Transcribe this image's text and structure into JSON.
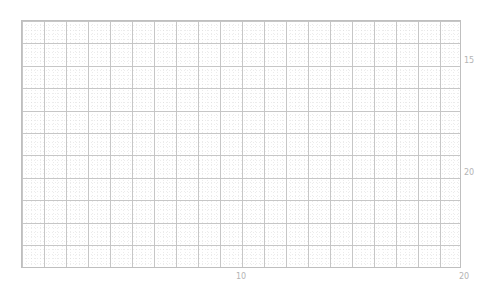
{
  "chart_data": {
    "type": "scatter",
    "title": "",
    "subtitle": "",
    "xlabel": "",
    "ylabel": "",
    "series": [
      {
        "name": "",
        "x": [],
        "y": []
      }
    ],
    "x": [],
    "values": [],
    "categories": [],
    "xlim": [
      1.0,
      20.4
    ],
    "ylim": [
      21.6,
      13.3
    ],
    "y_axis_inverted": true,
    "y_axis_side": "right",
    "grid": true,
    "grid_style": "dotted-minor-and-major",
    "legend": "none",
    "xticks": [
      {
        "value": 10,
        "label": "10",
        "px": 241
      },
      {
        "value": 20,
        "label": "20",
        "px": 464
      }
    ],
    "yticks": [
      {
        "value": 15,
        "label": "15",
        "px": 61
      },
      {
        "value": 20,
        "label": "20",
        "px": 173
      }
    ],
    "data_points_visible": 0,
    "note": "empty plot panel; no data markers rendered"
  },
  "figure": {
    "background_color": "#ffffff",
    "frame_color": "#bfbfbf",
    "grid_major_color": "#c4c4c4",
    "grid_minor_color": "#d7d7d7",
    "tick_label_color": "#b4b4b4"
  },
  "axes": {
    "x": {
      "ticks": [
        {
          "label": "10"
        },
        {
          "label": "20"
        }
      ]
    },
    "y": {
      "ticks": [
        {
          "label": "15"
        },
        {
          "label": "20"
        }
      ]
    }
  }
}
